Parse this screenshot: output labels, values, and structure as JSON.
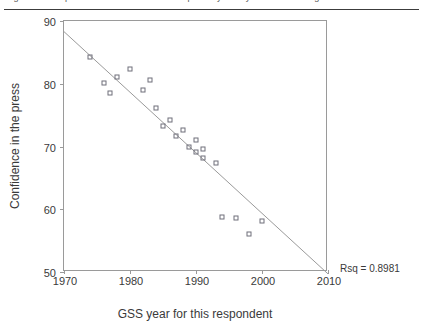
{
  "caption": {
    "text": "Figure: Scatterplot of mean confidence in the press by GSS year with fitted regression line"
  },
  "figure": {
    "rsq_label": "Rsq = 0.8981"
  },
  "chart_data": {
    "type": "scatter",
    "title": "",
    "xlabel": "GSS year for this respondent",
    "ylabel": "Confidence in the press",
    "xlim": [
      1970,
      2010
    ],
    "ylim": [
      50,
      90
    ],
    "xticks": [
      1970,
      1980,
      1990,
      2000,
      2010
    ],
    "yticks": [
      50,
      60,
      70,
      80,
      90
    ],
    "xtick_labels": [
      "1970",
      "1980",
      "1990",
      "2000",
      "2010"
    ],
    "ytick_labels": [
      "50",
      "60",
      "70",
      "80",
      "90"
    ],
    "grid": false,
    "legend": null,
    "marker": "open-square",
    "marker_color": "#6f6f7a",
    "line_color": "#9a9a9a",
    "annotations": [
      {
        "text": "Rsq = 0.8981",
        "x": 2012,
        "y": 51
      }
    ],
    "series": [
      {
        "name": "Confidence in the press",
        "type": "scatter",
        "points": [
          {
            "x": 1974,
            "y": 84.2
          },
          {
            "x": 1976,
            "y": 80.1
          },
          {
            "x": 1977,
            "y": 78.5
          },
          {
            "x": 1978,
            "y": 81.0
          },
          {
            "x": 1980,
            "y": 82.3
          },
          {
            "x": 1982,
            "y": 79.0
          },
          {
            "x": 1983,
            "y": 80.6
          },
          {
            "x": 1984,
            "y": 76.1
          },
          {
            "x": 1985,
            "y": 73.2
          },
          {
            "x": 1986,
            "y": 74.3
          },
          {
            "x": 1987,
            "y": 71.6
          },
          {
            "x": 1988,
            "y": 72.6
          },
          {
            "x": 1989,
            "y": 70.0
          },
          {
            "x": 1990,
            "y": 71.0
          },
          {
            "x": 1990,
            "y": 69.2
          },
          {
            "x": 1991,
            "y": 69.6
          },
          {
            "x": 1991,
            "y": 68.1
          },
          {
            "x": 1993,
            "y": 67.3
          },
          {
            "x": 1994,
            "y": 58.8
          },
          {
            "x": 1996,
            "y": 58.6
          },
          {
            "x": 1998,
            "y": 56.1
          },
          {
            "x": 2000,
            "y": 58.1
          }
        ]
      },
      {
        "name": "Linear fit",
        "type": "line",
        "endpoints": [
          {
            "x": 1970,
            "y": 88.3
          },
          {
            "x": 2010,
            "y": 49.7
          }
        ]
      }
    ]
  }
}
